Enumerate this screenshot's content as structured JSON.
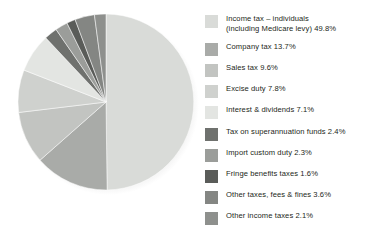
{
  "chart_data": {
    "type": "pie",
    "title": "",
    "subtitle": "",
    "xlabel": "",
    "ylabel": "",
    "units": "percent",
    "start_angle_deg": 0,
    "direction": "clockwise",
    "legend_position": "right",
    "grid": false,
    "total_percent": 100.0,
    "categories": [
      "Income tax – individuals (including Medicare levy)",
      "Company tax",
      "Sales tax",
      "Excise duty",
      "Interest & dividends",
      "Tax on superannuation funds",
      "Import custom duty",
      "Fringe benefits taxes",
      "Other taxes, fees & fines",
      "Other income taxes"
    ],
    "values": [
      49.8,
      13.7,
      9.6,
      7.8,
      7.1,
      2.4,
      2.3,
      1.6,
      3.6,
      2.1
    ],
    "colors": [
      "#d9dbd8",
      "#a9aba8",
      "#c2c4c1",
      "#cfd1ce",
      "#e3e5e2",
      "#6f716e",
      "#9b9d9a",
      "#5a5c59",
      "#848683",
      "#8e908d"
    ]
  },
  "legend": {
    "items": [
      {
        "label": "Income tax – individuals\n(including Medicare levy) 49.8%",
        "name": "income-tax-individuals",
        "value": "49.8%",
        "color": "#d9dbd8",
        "top": 4,
        "two_line": true
      },
      {
        "label": "Company tax 13.7%",
        "name": "company-tax",
        "value": "13.7%",
        "color": "#a9aba8",
        "top": 32,
        "two_line": false
      },
      {
        "label": "Sales tax 9.6%",
        "name": "sales-tax",
        "value": "9.6%",
        "color": "#c2c4c1",
        "top": 53,
        "two_line": false
      },
      {
        "label": "Excise duty 7.8%",
        "name": "excise-duty",
        "value": "7.8%",
        "color": "#cfd1ce",
        "top": 74,
        "two_line": false
      },
      {
        "label": "Interest & dividends 7.1%",
        "name": "interest-and-dividends",
        "value": "7.1%",
        "color": "#e3e5e2",
        "top": 95,
        "two_line": false
      },
      {
        "label": "Tax on superannuation funds 2.4%",
        "name": "tax-on-superannuation-funds",
        "value": "2.4%",
        "color": "#6f716e",
        "top": 117,
        "two_line": false
      },
      {
        "label": "Import custom duty 2.3%",
        "name": "import-custom-duty",
        "value": "2.3%",
        "color": "#9b9d9a",
        "top": 138,
        "two_line": false
      },
      {
        "label": "Fringe benefits taxes 1.6%",
        "name": "fringe-benefits-taxes",
        "value": "1.6%",
        "color": "#5a5c59",
        "top": 159,
        "two_line": false
      },
      {
        "label": "Other taxes, fees & fines 3.6%",
        "name": "other-taxes-fees-and-fines",
        "value": "3.6%",
        "color": "#848683",
        "top": 180,
        "two_line": false
      },
      {
        "label": "Other income taxes 2.1%",
        "name": "other-income-taxes",
        "value": "2.1%",
        "color": "#8e908d",
        "top": 201,
        "two_line": false
      }
    ]
  }
}
